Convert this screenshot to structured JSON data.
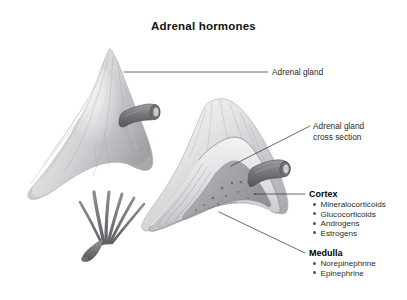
{
  "figure": {
    "title": "Adrenal hormones",
    "background_color": "#ffffff",
    "illustration_style": "grayscale pencil anatomical rendering"
  },
  "callouts": {
    "adrenal_gland": {
      "label": "Adrenal gland"
    },
    "cross_section": {
      "label_line1": "Adrenal gland",
      "label_line2": "cross section"
    }
  },
  "cortex": {
    "heading": "Cortex",
    "hormones": [
      "Mineralocorticoids",
      "Glucocorticoids",
      "Androgens",
      "Estrogens"
    ]
  },
  "medulla": {
    "heading": "Medulla",
    "hormones": [
      "Norepinephrine",
      "Epinephrine"
    ]
  },
  "colors": {
    "text": "#2b2b2b",
    "heading": "#000000",
    "leader_line": "#3a3a3a",
    "gland_light": "#e9e9ea",
    "gland_mid": "#c4c5c7",
    "gland_dark": "#8e9093",
    "vessel": "#6e7073"
  }
}
